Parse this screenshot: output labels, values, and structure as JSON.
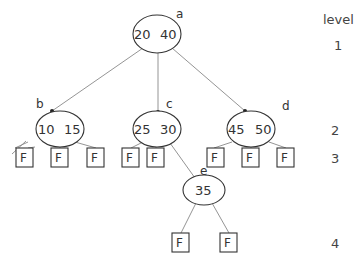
{
  "diagram": {
    "type": "2-3 tree",
    "level_header": "level",
    "levels": [
      {
        "label": "1",
        "y": 45
      },
      {
        "label": "2",
        "y": 132
      },
      {
        "label": "3",
        "y": 159
      },
      {
        "label": "4",
        "y": 245
      }
    ],
    "nodes": [
      {
        "id": "a",
        "name": "a",
        "keys": [
          "20",
          "40"
        ],
        "level": 1
      },
      {
        "id": "b",
        "name": "b",
        "keys": [
          "10",
          "15"
        ],
        "level": 2
      },
      {
        "id": "c",
        "name": "c",
        "keys": [
          "25",
          "30"
        ],
        "level": 2
      },
      {
        "id": "d",
        "name": "d",
        "keys": [
          "45",
          "50"
        ],
        "level": 2
      },
      {
        "id": "e",
        "name": "e",
        "keys": [
          "35"
        ],
        "level": 3
      }
    ],
    "leaf_label": "F",
    "leaf_count": 12,
    "edges": [
      [
        "a",
        "b"
      ],
      [
        "a",
        "c"
      ],
      [
        "a",
        "d"
      ],
      [
        "b",
        "F1"
      ],
      [
        "b",
        "F2"
      ],
      [
        "b",
        "F3"
      ],
      [
        "c",
        "F4"
      ],
      [
        "c",
        "F5"
      ],
      [
        "c",
        "e"
      ],
      [
        "d",
        "F6"
      ],
      [
        "d",
        "F7"
      ],
      [
        "d",
        "F8"
      ],
      [
        "e",
        "F9"
      ],
      [
        "e",
        "F10"
      ]
    ]
  }
}
